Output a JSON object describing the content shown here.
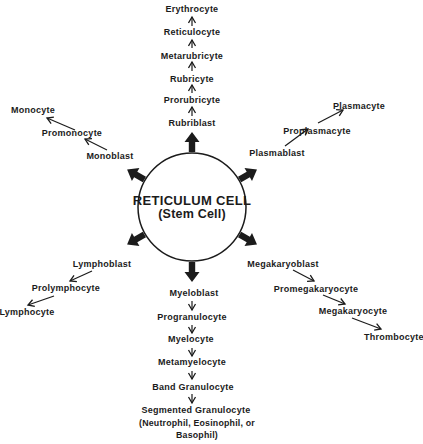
{
  "colors": {
    "ink": "#1b1b1b",
    "paper": "#ffffff"
  },
  "center": {
    "title": "RETICULUM CELL",
    "subtitle": "(Stem Cell)"
  },
  "lineages": {
    "erythroid": {
      "labels": [
        "Erythrocyte",
        "Reticulocyte",
        "Metarubricyte",
        "Rubricyte",
        "Prorubricyte",
        "Rubriblast"
      ]
    },
    "monocytic": {
      "labels": [
        "Monocyte",
        "Promonocyte",
        "Monoblast"
      ]
    },
    "plasmacytic": {
      "labels": [
        "Plasmacyte",
        "Proplasmacyte",
        "Plasmablast"
      ]
    },
    "lymphocytic": {
      "labels": [
        "Lymphoblast",
        "Prolymphocyte",
        "Lymphocyte"
      ]
    },
    "megakaryocytic": {
      "labels": [
        "Megakaryoblast",
        "Promegakaryocyte",
        "Megakaryocyte",
        "Thrombocyte"
      ]
    },
    "granulocytic": {
      "labels": [
        "Myeloblast",
        "Progranulocyte",
        "Myelocyte",
        "Metamyelocyte",
        "Band Granulocyte",
        "Segmented Granulocyte"
      ],
      "note": "(Neutrophil, Eosinophil, or Basophil)"
    }
  }
}
